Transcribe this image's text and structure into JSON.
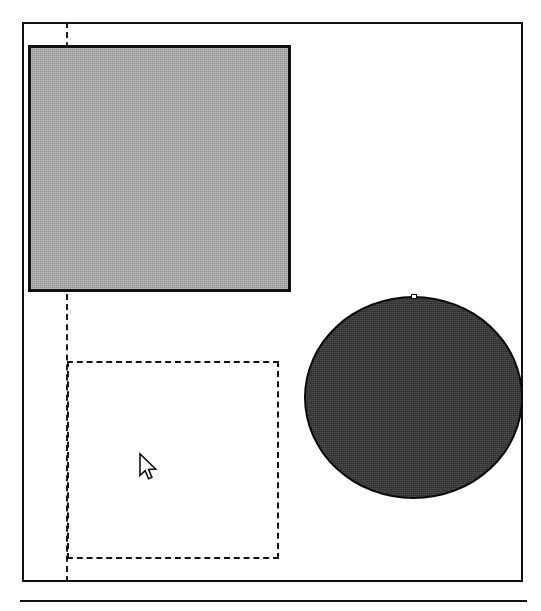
{
  "figure": {
    "background_color": "#ffffff",
    "width": 541,
    "height": 611
  },
  "frame": {
    "name": "outer-frame",
    "stroke_color": "#111111",
    "stroke_width": 2,
    "x": 22,
    "y": 22,
    "width": 501,
    "height": 560
  },
  "guide_line": {
    "name": "vertical-dashed-guide",
    "orientation": "vertical",
    "stroke_color": "#1a1a1a",
    "stroke_style": "dashed",
    "stroke_width": 2,
    "x": 66,
    "y_start": 22,
    "y_end": 582
  },
  "shapes": [
    {
      "name": "filled-rectangle",
      "kind": "rectangle",
      "fill_color": "#a8a8a8",
      "stroke_color": "#101010",
      "stroke_width": 3,
      "stroke_style": "solid",
      "x": 28,
      "y": 45,
      "width": 263,
      "height": 247
    },
    {
      "name": "dashed-rectangle",
      "kind": "rectangle",
      "fill_color": "none",
      "stroke_color": "#141414",
      "stroke_width": 2,
      "stroke_style": "dashed",
      "x": 67,
      "y": 361,
      "width": 212,
      "height": 198
    },
    {
      "name": "filled-ellipse",
      "kind": "ellipse",
      "fill_color": "#383838",
      "stroke_color": "#0a0a0a",
      "stroke_width": 2,
      "stroke_style": "solid",
      "x": 304,
      "y": 296,
      "width": 219,
      "height": 203,
      "center_x": 413,
      "center_y": 398,
      "radius_x": 109,
      "radius_y": 101
    }
  ],
  "cursor": {
    "name": "mouse-pointer",
    "kind": "arrow",
    "fill_color": "#ffffff",
    "stroke_color": "#111111",
    "x": 138,
    "y": 452
  },
  "bottom_rule": {
    "name": "horizontal-rule",
    "stroke_color": "#111111",
    "stroke_width": 2,
    "x": 20,
    "y": 600,
    "width": 507
  }
}
